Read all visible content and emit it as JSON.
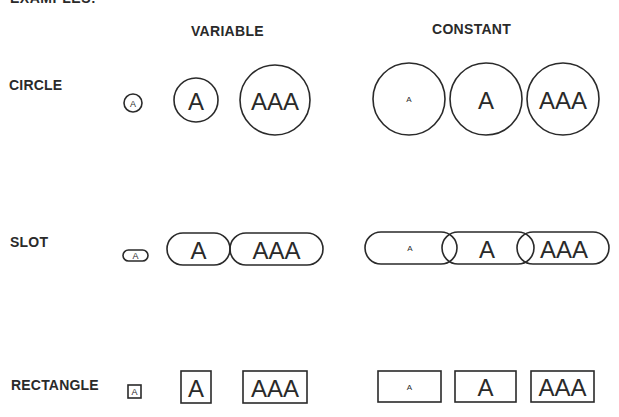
{
  "title": "EXAMPLES:",
  "columns": {
    "variable": "VARIABLE",
    "constant": "CONSTANT"
  },
  "rows": [
    {
      "label": "CIRCLE",
      "shape": "circle",
      "variable": [
        {
          "text": "A",
          "size": "small"
        },
        {
          "text": "A",
          "size": "medium"
        },
        {
          "text": "AAA",
          "size": "large"
        }
      ],
      "constant": [
        {
          "text": "A",
          "text_size": "small"
        },
        {
          "text": "A",
          "text_size": "medium"
        },
        {
          "text": "AAA",
          "text_size": "large"
        }
      ]
    },
    {
      "label": "SLOT",
      "shape": "slot",
      "variable": [
        {
          "text": "A",
          "size": "small"
        },
        {
          "text": "A",
          "size": "medium"
        },
        {
          "text": "AAA",
          "size": "large"
        }
      ],
      "constant": [
        {
          "text": "A",
          "text_size": "small"
        },
        {
          "text": "A",
          "text_size": "medium"
        },
        {
          "text": "AAA",
          "text_size": "large"
        }
      ]
    },
    {
      "label": "RECTANGLE",
      "shape": "rectangle",
      "variable": [
        {
          "text": "A",
          "size": "small"
        },
        {
          "text": "A",
          "size": "medium"
        },
        {
          "text": "AAA",
          "size": "large"
        }
      ],
      "constant": [
        {
          "text": "A",
          "text_size": "small"
        },
        {
          "text": "A",
          "text_size": "medium"
        },
        {
          "text": "AAA",
          "text_size": "large"
        }
      ]
    }
  ],
  "colors": {
    "stroke": "#2a2a2a",
    "background": "#ffffff"
  }
}
